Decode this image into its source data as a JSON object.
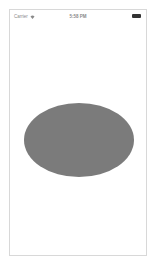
{
  "status_bar": {
    "carrier": "Carrier",
    "wifi_icon": "wifi-icon",
    "time": "5:58 PM",
    "battery_icon": "battery-icon"
  },
  "canvas": {
    "shape": "ellipse",
    "fill_color": "#7b7b7b",
    "background_color": "#ffffff"
  }
}
